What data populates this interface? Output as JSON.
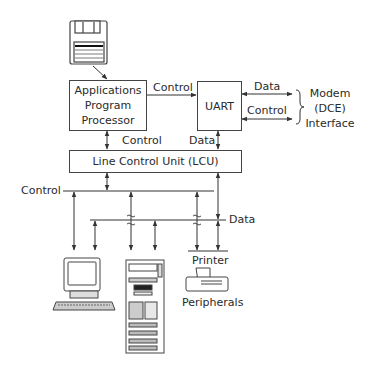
{
  "diagram": {
    "type": "block-diagram",
    "nodes": {
      "floppy": {
        "icon": "floppy-disk-icon"
      },
      "app_processor": {
        "label": "Applications Program Processor",
        "lines": [
          "Applications",
          "Program",
          "Processor"
        ]
      },
      "uart": {
        "label": "UART"
      },
      "lcu": {
        "label": "Line Control Unit (LCU)"
      },
      "modem_interface": {
        "label": "Modem (DCE) Interface",
        "lines": [
          "Modem",
          "(DCE)",
          "Interface"
        ]
      },
      "terminal": {
        "icon": "computer-terminal-icon"
      },
      "tower": {
        "icon": "server-tower-icon"
      },
      "printer": {
        "label": "Printer",
        "icon": "printer-icon"
      },
      "peripherals": {
        "label": "Peripherals"
      }
    },
    "edges": {
      "app_to_uart": {
        "label": "Control"
      },
      "uart_modem_data": {
        "label": "Data"
      },
      "uart_modem_control": {
        "label": "Control"
      },
      "app_lcu": {
        "label": "Control"
      },
      "uart_lcu": {
        "label": "Data"
      },
      "control_bus": {
        "label": "Control"
      },
      "data_bus": {
        "label": "Data"
      }
    }
  }
}
